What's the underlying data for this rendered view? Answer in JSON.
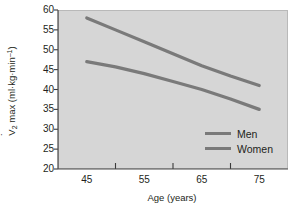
{
  "chart_data": {
    "type": "line",
    "title": "",
    "xlabel": "Age (years)",
    "ylabel": "V̇O2 max (ml·kg·min⁻¹)",
    "ylabel_parts": {
      "prefix": "V",
      "sub": "2",
      "mid": " max (ml·kg·min",
      "sup": "–1",
      "suffix": ")"
    },
    "x": [
      45,
      55,
      65,
      75
    ],
    "xlim": [
      40,
      80
    ],
    "ylim": [
      20,
      60
    ],
    "xticklabels": [
      "45",
      "55",
      "65",
      "75"
    ],
    "yticklabels": [
      "60",
      "55",
      "50",
      "45",
      "40",
      "35",
      "30",
      "25",
      "20"
    ],
    "ytickvalues": [
      60,
      55,
      50,
      45,
      40,
      35,
      30,
      25,
      20
    ],
    "xminorticks": [
      50,
      60,
      70
    ],
    "grid": false,
    "legend_position": "center-right-inside",
    "panel_color": "#d6d6d6",
    "line_color": "#7a7a7a",
    "text_color": "#231f20",
    "series": [
      {
        "name": "Men",
        "color": "#7a7a7a",
        "values": [
          58,
          52,
          46,
          41
        ],
        "points": [
          {
            "x": 45,
            "y": 58
          },
          {
            "x": 50,
            "y": 55
          },
          {
            "x": 55,
            "y": 52
          },
          {
            "x": 60,
            "y": 49
          },
          {
            "x": 65,
            "y": 46
          },
          {
            "x": 70,
            "y": 43.4
          },
          {
            "x": 75,
            "y": 41
          }
        ]
      },
      {
        "name": "Women",
        "color": "#7a7a7a",
        "values": [
          47,
          44,
          40,
          35
        ],
        "points": [
          {
            "x": 45,
            "y": 47
          },
          {
            "x": 50,
            "y": 45.7
          },
          {
            "x": 55,
            "y": 44
          },
          {
            "x": 60,
            "y": 42
          },
          {
            "x": 65,
            "y": 40
          },
          {
            "x": 70,
            "y": 37.6
          },
          {
            "x": 75,
            "y": 35
          }
        ]
      }
    ]
  },
  "legend": {
    "items": [
      {
        "label": "Men"
      },
      {
        "label": "Women"
      }
    ]
  }
}
